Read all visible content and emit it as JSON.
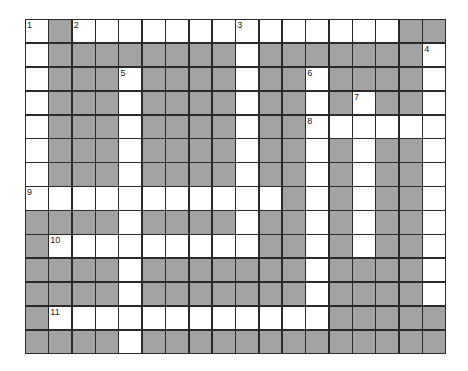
{
  "puzzle": {
    "rows": 14,
    "cols": 18,
    "colors": {
      "block": "#a3a3a3",
      "open": "#ffffff",
      "line": "#2a2a2a"
    },
    "grid": [
      ".#..............###",
      ".########.#######.",
      ".###.####.##.####.",
      ".###.####.##.#.##.",
      ".###.####.##......",
      ".###.####.##.#.##.",
      ".###.####.##.#.##.",
      "...........#.#.##.",
      "####.####.##.#.##.",
      "#.........##.#.##.",
      "####.#######.####.",
      "####.#######.####.",
      "#............#####",
      "####.#############"
    ],
    "numbers": [
      {
        "row": 0,
        "col": 0,
        "label": "1"
      },
      {
        "row": 0,
        "col": 2,
        "label": "2"
      },
      {
        "row": 0,
        "col": 9,
        "label": "3"
      },
      {
        "row": 1,
        "col": 17,
        "label": "4"
      },
      {
        "row": 2,
        "col": 4,
        "label": "5"
      },
      {
        "row": 2,
        "col": 12,
        "label": "6"
      },
      {
        "row": 3,
        "col": 14,
        "label": "7"
      },
      {
        "row": 4,
        "col": 12,
        "label": "8"
      },
      {
        "row": 7,
        "col": 0,
        "label": "9"
      },
      {
        "row": 9,
        "col": 1,
        "label": "10"
      },
      {
        "row": 12,
        "col": 1,
        "label": "11"
      }
    ]
  }
}
